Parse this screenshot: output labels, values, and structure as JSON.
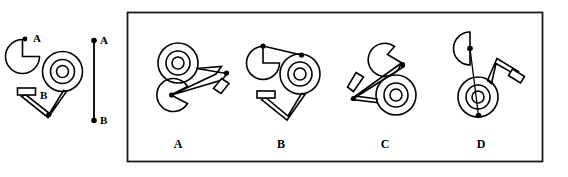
{
  "question": {
    "type": "mental-rotation-multiple-choice",
    "reference_labels": {
      "point_a": "A",
      "point_b": "B"
    },
    "axis_labels": {
      "top": "A",
      "bottom": "B"
    }
  },
  "reference_figure": {
    "name": "reference-object",
    "parts": [
      {
        "name": "pac-man-disc",
        "label": "A"
      },
      {
        "name": "concentric-wheel",
        "rings": 3
      },
      {
        "name": "v-bracket",
        "label": "B"
      },
      {
        "name": "small-rectangle-tab"
      }
    ],
    "point_a_label": "A",
    "point_b_label": "B"
  },
  "axis": {
    "name": "rotation-axis",
    "top_label": "A",
    "bottom_label": "B",
    "top_dot": true,
    "bottom_dot": true
  },
  "choices": [
    {
      "id": "A",
      "label": "A",
      "name": "choice-a"
    },
    {
      "id": "B",
      "label": "B",
      "name": "choice-b"
    },
    {
      "id": "C",
      "label": "C",
      "name": "choice-c"
    },
    {
      "id": "D",
      "label": "D",
      "name": "choice-d"
    }
  ],
  "colors": {
    "ink": "#000000",
    "frame": "#1a1a1a",
    "background": "#ffffff"
  }
}
